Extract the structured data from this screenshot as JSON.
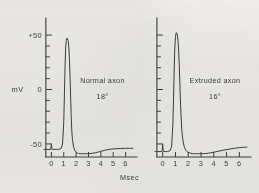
{
  "figure": {
    "background_color": "#efeeea",
    "ink_color": "#3d3d3d",
    "x_axis_label": "Msec",
    "y_axis_unit": "mV"
  },
  "chart_data": {
    "type": "line",
    "title": "",
    "xlabel": "Msec",
    "ylabel": "mV",
    "xlim": [
      -0.6,
      6.6
    ],
    "ylim": [
      -62,
      62
    ],
    "xticks": [
      0,
      1,
      2,
      3,
      4,
      5,
      6
    ],
    "xtick_labels": [
      "0",
      "1",
      "2",
      "3",
      "4",
      "5",
      "6"
    ],
    "yticks": [
      -50,
      -40,
      -30,
      -20,
      -10,
      0,
      10,
      20,
      30,
      40,
      50
    ],
    "ytick_labels_major": [
      "+50",
      "0",
      "-50"
    ],
    "ytick_major_values": [
      50,
      0,
      -50
    ],
    "grid": false,
    "legend": "none",
    "panels": [
      {
        "id": "normal-axon",
        "annotation_line1": "Normal axon",
        "annotation_line2": "18°",
        "temperature_c": 18,
        "resting_potential_mv": -55,
        "peak_potential_mv": 47,
        "peak_time_msec": 1.3,
        "stimulus_artifact_time_msec": 0.05,
        "undershoot_min_mv": -59,
        "undershoot_time_msec": 3.1,
        "show_y_axis_labels": true,
        "series": [
          {
            "name": "membrane potential",
            "x": [
              -0.6,
              -0.4,
              -0.2,
              -0.05,
              0,
              0.05,
              0.1,
              0.2,
              0.4,
              0.6,
              0.8,
              0.9,
              1.0,
              1.05,
              1.1,
              1.15,
              1.2,
              1.25,
              1.3,
              1.35,
              1.4,
              1.45,
              1.5,
              1.55,
              1.6,
              1.65,
              1.7,
              1.8,
              1.9,
              2.0,
              2.1,
              2.2,
              2.4,
              2.6,
              2.8,
              3.0,
              3.2,
              3.6,
              4.0,
              4.4,
              4.8,
              5.2,
              5.6,
              6.0,
              6.4,
              6.6
            ],
            "y": [
              -55,
              -55,
              -55,
              -55,
              -50,
              -55,
              -55,
              -55,
              -55,
              -55,
              -54,
              -50,
              -30,
              -5,
              20,
              38,
              45,
              47,
              47,
              45,
              40,
              30,
              14,
              -5,
              -24,
              -38,
              -46,
              -53,
              -56,
              -57.5,
              -58.3,
              -58.8,
              -59,
              -59,
              -59,
              -59,
              -58.8,
              -58,
              -56.8,
              -55.6,
              -54.8,
              -54.4,
              -54.2,
              -54,
              -54,
              -54
            ]
          }
        ]
      },
      {
        "id": "extruded-axon",
        "annotation_line1": "Extruded axon",
        "annotation_line2": "16°",
        "temperature_c": 16,
        "resting_potential_mv": -57,
        "peak_potential_mv": 52,
        "peak_time_msec": 1.1,
        "stimulus_artifact_time_msec": 0.05,
        "undershoot_min_mv": -59,
        "undershoot_time_msec": 3.2,
        "show_y_axis_labels": false,
        "series": [
          {
            "name": "membrane potential",
            "x": [
              -0.6,
              -0.4,
              -0.2,
              -0.05,
              0,
              0.05,
              0.1,
              0.2,
              0.4,
              0.6,
              0.7,
              0.8,
              0.85,
              0.9,
              0.95,
              1.0,
              1.05,
              1.1,
              1.15,
              1.2,
              1.25,
              1.3,
              1.35,
              1.4,
              1.5,
              1.6,
              1.7,
              1.8,
              1.9,
              2.0,
              2.2,
              2.4,
              2.6,
              2.8,
              3.0,
              3.2,
              3.6,
              4.0,
              4.4,
              4.8,
              5.2,
              5.6,
              6.0,
              6.4,
              6.6
            ],
            "y": [
              -57,
              -57,
              -57,
              -57,
              -50,
              -57,
              -57,
              -57,
              -57,
              -56,
              -52,
              -32,
              -8,
              18,
              38,
              48,
              52,
              52,
              50,
              45,
              36,
              22,
              4,
              -14,
              -38,
              -48,
              -53,
              -55.5,
              -57,
              -57.8,
              -58.6,
              -59,
              -59,
              -59,
              -59,
              -59,
              -58.5,
              -57.6,
              -56.6,
              -55.6,
              -54.8,
              -54,
              -53.4,
              -53,
              -53
            ]
          }
        ]
      }
    ]
  }
}
